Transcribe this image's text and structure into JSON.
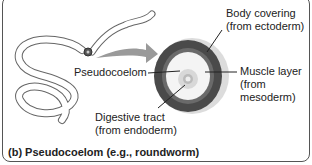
{
  "diagram": {
    "caption": "(b) Pseudocoelom (e.g., roundworm)",
    "labels": {
      "body_covering_1": "Body covering",
      "body_covering_2": "(from ectoderm)",
      "pseudocoelom": "Pseudocoelom",
      "muscle_1": "Muscle layer",
      "muscle_2": "(from",
      "muscle_3": "mesoderm)",
      "digestive_1": "Digestive tract",
      "digestive_2": "(from endoderm)"
    },
    "colors": {
      "ectoderm": "#dcdcdc",
      "mesoderm": "#5a5a5a",
      "pseudocoelom": "#f2f2f2",
      "endoderm": "#c8c8c8",
      "arrow": "#9a9a9a",
      "worm_outline": "#666666"
    }
  }
}
